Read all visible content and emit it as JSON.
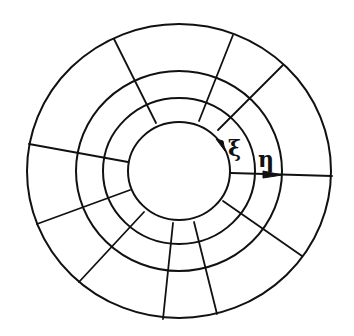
{
  "diagram": {
    "type": "polar-grid",
    "center": [
      179,
      171
    ],
    "rings": [
      {
        "name": "inner",
        "rx": 51,
        "ry": 49
      },
      {
        "name": "ring-3",
        "rx": 76,
        "ry": 73
      },
      {
        "name": "ring-2",
        "rx": 103,
        "ry": 100
      },
      {
        "name": "outer",
        "rx": 152,
        "ry": 147
      }
    ],
    "spokes": [
      {
        "from": [
          156,
          123
        ],
        "to": [
          114,
          39
        ]
      },
      {
        "from": [
          199,
          121
        ],
        "to": [
          233,
          35
        ]
      },
      {
        "from": [
          218,
          130
        ],
        "to": [
          283,
          65
        ]
      },
      {
        "from": [
          128,
          162
        ],
        "to": [
          29,
          144
        ]
      },
      {
        "from": [
          130,
          190
        ],
        "to": [
          37,
          224
        ]
      },
      {
        "from": [
          144,
          212
        ],
        "to": [
          79,
          282
        ]
      },
      {
        "from": [
          173,
          223
        ],
        "to": [
          163,
          319
        ]
      },
      {
        "from": [
          194,
          222
        ],
        "to": [
          217,
          314
        ]
      },
      {
        "from": [
          223,
          201
        ],
        "to": [
          302,
          256
        ]
      },
      {
        "from": [
          232,
          173
        ],
        "to": [
          332,
          176
        ]
      }
    ],
    "labels": {
      "xi": "ξ",
      "eta": "η"
    },
    "colors": {
      "stroke": "#111111",
      "background": "#ffffff"
    }
  }
}
